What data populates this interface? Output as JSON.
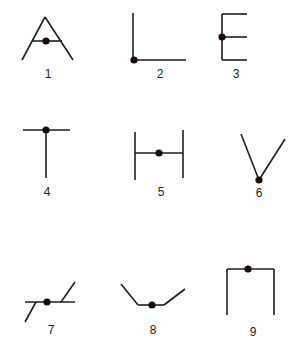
{
  "diagram": {
    "colors": {
      "line": "#1e1e1e",
      "dot": "#1a0a0a",
      "label": "#222222",
      "background": "#ffffff"
    },
    "figures": [
      {
        "label": "1",
        "shape": "A-shape",
        "lines": [
          [
            45,
            17,
            22,
            60
          ],
          [
            45,
            17,
            73,
            60
          ],
          [
            32,
            41,
            62,
            41
          ]
        ],
        "dot": [
          46,
          41
        ],
        "label_pos": [
          48,
          78
        ]
      },
      {
        "label": "2",
        "shape": "L-shape",
        "lines": [
          [
            133,
            13,
            133,
            60
          ],
          [
            133,
            60,
            186,
            60
          ]
        ],
        "dot": [
          134,
          60
        ],
        "label_pos": [
          160,
          78
        ]
      },
      {
        "label": "3",
        "shape": "E-shape",
        "lines": [
          [
            222,
            14,
            222,
            60
          ],
          [
            222,
            14,
            247,
            14
          ],
          [
            222,
            37,
            247,
            37
          ],
          [
            222,
            60,
            247,
            60
          ]
        ],
        "dot": [
          222,
          37
        ],
        "label_pos": [
          236,
          78
        ]
      },
      {
        "label": "4",
        "shape": "T-shape",
        "lines": [
          [
            23,
            130,
            70,
            130
          ],
          [
            46,
            130,
            46,
            178
          ]
        ],
        "dot": [
          46,
          130
        ],
        "label_pos": [
          47,
          196
        ]
      },
      {
        "label": "5",
        "shape": "H-shape",
        "lines": [
          [
            135,
            132,
            135,
            180
          ],
          [
            183,
            130,
            183,
            178
          ],
          [
            135,
            153,
            183,
            153
          ]
        ],
        "dot": [
          159,
          153
        ],
        "label_pos": [
          161,
          196
        ]
      },
      {
        "label": "6",
        "shape": "V-shape",
        "lines": [
          [
            241,
            134,
            259,
            180
          ],
          [
            259,
            180,
            285,
            139
          ]
        ],
        "dot": [
          259,
          180
        ],
        "label_pos": [
          259,
          197
        ]
      },
      {
        "label": "7",
        "shape": "Z-shape",
        "lines": [
          [
            25,
            302,
            75,
            302
          ],
          [
            36,
            302,
            25,
            322
          ],
          [
            61,
            302,
            75,
            282
          ]
        ],
        "dot": [
          47,
          302
        ],
        "label_pos": [
          51,
          334
        ]
      },
      {
        "label": "8",
        "shape": "trough-shape",
        "lines": [
          [
            121,
            284,
            138,
            305
          ],
          [
            138,
            305,
            164,
            305
          ],
          [
            164,
            305,
            185,
            289
          ]
        ],
        "dot": [
          152,
          305
        ],
        "label_pos": [
          153,
          334
        ]
      },
      {
        "label": "9",
        "shape": "inverted-U-shape",
        "lines": [
          [
            227,
            269,
            274,
            269
          ],
          [
            227,
            269,
            227,
            315
          ],
          [
            274,
            269,
            274,
            315
          ]
        ],
        "dot": [
          248,
          269
        ],
        "label_pos": [
          253,
          336
        ]
      }
    ]
  }
}
